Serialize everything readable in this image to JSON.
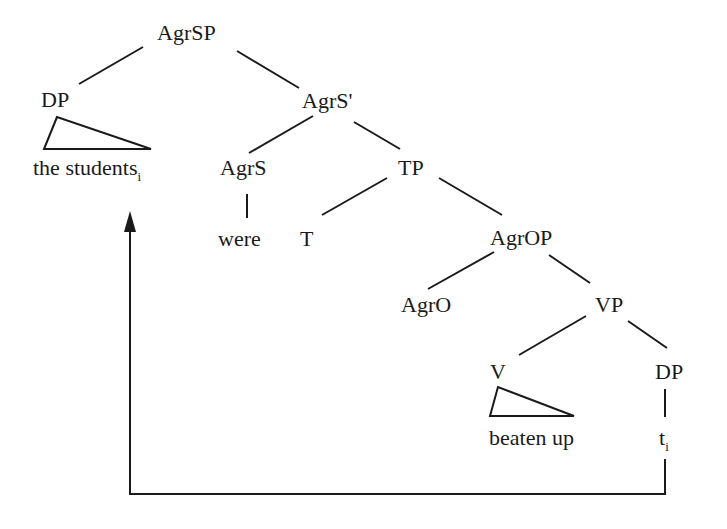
{
  "diagram": {
    "type": "syntax-tree",
    "nodes": {
      "agrsp": "AgrSP",
      "dp_subject": "DP",
      "the_students": "the students",
      "the_students_index": "i",
      "agrs_bar": "AgrS'",
      "agrs": "AgrS",
      "were": "were",
      "tp": "TP",
      "t": "T",
      "agrop": "AgrOP",
      "agro": "AgrO",
      "vp": "VP",
      "v": "V",
      "beaten_up": "beaten up",
      "dp_object": "DP",
      "trace": "t",
      "trace_index": "i"
    },
    "edges": [
      [
        "AgrSP",
        "DP"
      ],
      [
        "AgrSP",
        "AgrS'"
      ],
      [
        "AgrS'",
        "AgrS"
      ],
      [
        "AgrS'",
        "TP"
      ],
      [
        "AgrS",
        "were"
      ],
      [
        "TP",
        "T"
      ],
      [
        "TP",
        "AgrOP"
      ],
      [
        "AgrOP",
        "AgrO"
      ],
      [
        "AgrOP",
        "VP"
      ],
      [
        "VP",
        "V"
      ],
      [
        "VP",
        "DP"
      ],
      [
        "DP",
        "t_i"
      ]
    ],
    "triangles": [
      "DP -> the students",
      "V -> beaten up"
    ],
    "movement_arrow": {
      "from": "t_i",
      "to": "the students_i"
    },
    "line_color": "#1a1a1a"
  }
}
